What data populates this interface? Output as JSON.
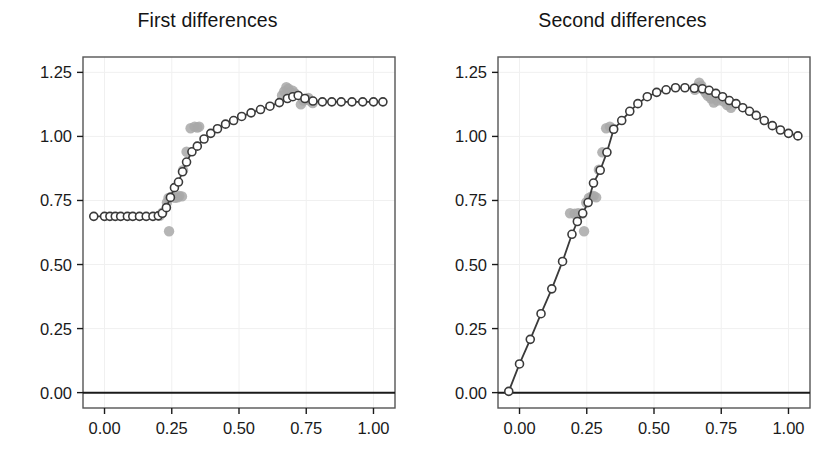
{
  "figure": {
    "background_color": "#ffffff",
    "panel_count": 2
  },
  "style": {
    "line_color": "#3a3a3a",
    "open_marker_stroke": "#3a3a3a",
    "open_marker_fill": "#ffffff",
    "raw_point_color": "#a8a8a8",
    "frame_color": "#555555",
    "grid_color": "#f0f0f0",
    "axis_color": "#1a1a1a",
    "tick_label_color": "#1a1a1a"
  },
  "chart_data": [
    {
      "type": "scatter",
      "panel_index": 0,
      "title": "First differences",
      "xlabel": "",
      "ylabel": "",
      "xlim": [
        -0.08,
        1.08
      ],
      "ylim": [
        -0.06,
        1.31
      ],
      "xticks": [
        0.0,
        0.25,
        0.5,
        0.75,
        1.0
      ],
      "xticklabels": [
        "0.00",
        "0.25",
        "0.50",
        "0.75",
        "1.00"
      ],
      "yticks": [
        0.0,
        0.25,
        0.5,
        0.75,
        1.0,
        1.25
      ],
      "yticklabels": [
        "0.00",
        "0.25",
        "0.50",
        "0.75",
        "1.00",
        "1.25"
      ],
      "grid": true,
      "zero_line": 0.0,
      "series": [
        {
          "name": "fitted",
          "style": "line-with-open-circles",
          "x": [
            -0.04,
            0.0,
            0.02,
            0.04,
            0.06,
            0.085,
            0.105,
            0.13,
            0.155,
            0.18,
            0.2,
            0.215,
            0.23,
            0.245,
            0.26,
            0.275,
            0.29,
            0.305,
            0.325,
            0.345,
            0.37,
            0.395,
            0.42,
            0.45,
            0.48,
            0.51,
            0.545,
            0.58,
            0.615,
            0.65,
            0.68,
            0.7,
            0.72,
            0.745,
            0.775,
            0.81,
            0.845,
            0.88,
            0.92,
            0.96,
            1.0,
            1.035
          ],
          "y": [
            0.688,
            0.688,
            0.688,
            0.688,
            0.688,
            0.688,
            0.688,
            0.688,
            0.688,
            0.688,
            0.69,
            0.7,
            0.722,
            0.762,
            0.8,
            0.822,
            0.862,
            0.9,
            0.94,
            0.962,
            0.99,
            1.012,
            1.03,
            1.048,
            1.062,
            1.078,
            1.092,
            1.105,
            1.118,
            1.132,
            1.148,
            1.155,
            1.16,
            1.148,
            1.138,
            1.135,
            1.135,
            1.135,
            1.135,
            1.135,
            1.135,
            1.135
          ]
        },
        {
          "name": "observed",
          "style": "filled-gray-circles",
          "x": [
            0.205,
            0.215,
            0.232,
            0.238,
            0.24,
            0.25,
            0.262,
            0.272,
            0.278,
            0.288,
            0.292,
            0.305,
            0.32,
            0.335,
            0.345,
            0.352,
            0.66,
            0.668,
            0.676,
            0.684,
            0.692,
            0.7,
            0.708,
            0.73,
            0.74,
            0.75,
            0.758,
            0.766,
            0.774
          ],
          "y": [
            0.69,
            0.702,
            0.742,
            0.76,
            0.63,
            0.765,
            0.76,
            0.762,
            0.768,
            0.766,
            0.868,
            0.94,
            1.032,
            1.038,
            1.035,
            1.038,
            1.16,
            1.176,
            1.192,
            1.186,
            1.172,
            1.178,
            1.168,
            1.125,
            1.14,
            1.146,
            1.15,
            1.138,
            1.13
          ]
        }
      ]
    },
    {
      "type": "scatter",
      "panel_index": 1,
      "title": "Second differences",
      "xlabel": "",
      "ylabel": "",
      "xlim": [
        -0.08,
        1.08
      ],
      "ylim": [
        -0.06,
        1.31
      ],
      "xticks": [
        0.0,
        0.25,
        0.5,
        0.75,
        1.0
      ],
      "xticklabels": [
        "0.00",
        "0.25",
        "0.50",
        "0.75",
        "1.00"
      ],
      "yticks": [
        0.0,
        0.25,
        0.5,
        0.75,
        1.0,
        1.25
      ],
      "yticklabels": [
        "0.00",
        "0.25",
        "0.50",
        "0.75",
        "1.00",
        "1.25"
      ],
      "grid": true,
      "zero_line": 0.0,
      "series": [
        {
          "name": "fitted",
          "style": "line-with-open-circles",
          "x": [
            -0.04,
            0.0,
            0.04,
            0.08,
            0.12,
            0.16,
            0.195,
            0.215,
            0.235,
            0.255,
            0.275,
            0.3,
            0.325,
            0.35,
            0.38,
            0.41,
            0.44,
            0.475,
            0.51,
            0.545,
            0.58,
            0.615,
            0.65,
            0.68,
            0.705,
            0.73,
            0.755,
            0.78,
            0.805,
            0.83,
            0.855,
            0.88,
            0.91,
            0.94,
            0.97,
            1.0,
            1.035
          ],
          "y": [
            0.005,
            0.112,
            0.208,
            0.308,
            0.405,
            0.512,
            0.618,
            0.668,
            0.7,
            0.742,
            0.818,
            0.868,
            0.938,
            1.028,
            1.062,
            1.098,
            1.128,
            1.155,
            1.172,
            1.182,
            1.19,
            1.19,
            1.188,
            1.186,
            1.18,
            1.168,
            1.155,
            1.14,
            1.128,
            1.112,
            1.098,
            1.082,
            1.062,
            1.042,
            1.025,
            1.012,
            1.002
          ]
        },
        {
          "name": "observed",
          "style": "filled-gray-circles",
          "x": [
            0.188,
            0.205,
            0.218,
            0.232,
            0.24,
            0.248,
            0.258,
            0.268,
            0.276,
            0.285,
            0.295,
            0.308,
            0.322,
            0.336,
            0.348,
            0.652,
            0.66,
            0.668,
            0.676,
            0.684,
            0.692,
            0.7,
            0.712,
            0.722,
            0.736,
            0.748,
            0.76,
            0.772,
            0.786
          ],
          "y": [
            0.7,
            0.698,
            0.7,
            0.698,
            0.63,
            0.742,
            0.76,
            0.766,
            0.768,
            0.762,
            0.87,
            0.938,
            1.032,
            1.038,
            1.03,
            1.182,
            1.192,
            1.21,
            1.198,
            1.182,
            1.17,
            1.158,
            1.148,
            1.132,
            1.14,
            1.148,
            1.136,
            1.122,
            1.112
          ]
        }
      ]
    }
  ]
}
